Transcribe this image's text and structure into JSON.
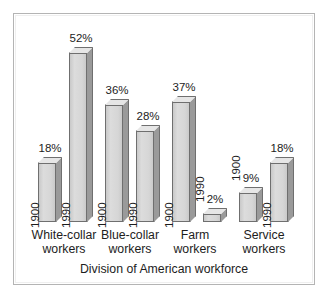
{
  "chart_data": {
    "type": "bar",
    "title": "",
    "xlabel": "Division of American workforce",
    "ylabel": "",
    "ylim": [
      0,
      56
    ],
    "grid": false,
    "legend": "none",
    "categories": [
      "White-collar workers",
      "Blue-collar workers",
      "Farm workers",
      "Service workers"
    ],
    "series": [
      {
        "name": "1900",
        "values": [
          18,
          36,
          37,
          9
        ]
      },
      {
        "name": "1990",
        "values": [
          52,
          28,
          2,
          18
        ]
      }
    ],
    "bars": [
      {
        "category": "White-collar workers",
        "year": "1900",
        "value": 18,
        "value_label": "18%",
        "year_label_inside": true
      },
      {
        "category": "White-collar workers",
        "year": "1990",
        "value": 52,
        "value_label": "52%",
        "year_label_inside": true
      },
      {
        "category": "Blue-collar workers",
        "year": "1900",
        "value": 36,
        "value_label": "36%",
        "year_label_inside": true
      },
      {
        "category": "Blue-collar workers",
        "year": "1990",
        "value": 28,
        "value_label": "28%",
        "year_label_inside": true
      },
      {
        "category": "Farm workers",
        "year": "1900",
        "value": 37,
        "value_label": "37%",
        "year_label_inside": true
      },
      {
        "category": "Farm workers",
        "year": "1990",
        "value": 2,
        "value_label": "2%",
        "year_label_inside": false
      },
      {
        "category": "Service workers",
        "year": "1900",
        "value": 9,
        "value_label": "9%",
        "year_label_inside": false
      },
      {
        "category": "Service workers",
        "year": "1990",
        "value": 18,
        "value_label": "18%",
        "year_label_inside": true
      }
    ],
    "colors": {
      "bar_face": "#d6d6d6",
      "bar_side": "#9a9a9a",
      "bar_top": "#e6e6e6",
      "bar_outline": "#6f6f6f",
      "frame": "#b4b4b4",
      "background": "#ffffff",
      "text": "#1d1d1d"
    }
  },
  "axis": {
    "title": "Division of American workforce"
  },
  "categories": [
    {
      "line1": "White-collar",
      "line2": "workers"
    },
    {
      "line1": "Blue-collar",
      "line2": "workers"
    },
    {
      "line1": "Farm",
      "line2": "workers"
    },
    {
      "line1": "Service",
      "line2": "workers"
    }
  ]
}
